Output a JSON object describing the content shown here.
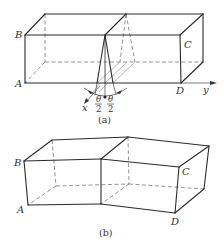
{
  "figure_a": {
    "caption": "(a)",
    "vertex_labels": {
      "B": "B",
      "C": "C",
      "A": "A",
      "D": "D"
    },
    "axis_labels": {
      "x": "x",
      "y": "y"
    },
    "angle_label": {
      "numerator": "θ",
      "denominator": "2"
    },
    "description": "Rectangular box split by a wedge-shaped cut at the midplane; wedge opening angle θ symmetric about the vertical plane (θ/2 each side)"
  },
  "figure_b": {
    "caption": "(b)",
    "vertex_labels": {
      "B": "B",
      "C": "C",
      "A": "A",
      "D": "D"
    },
    "description": "Box after bending: the two halves rotated by θ about the vertical edge at the middle"
  }
}
